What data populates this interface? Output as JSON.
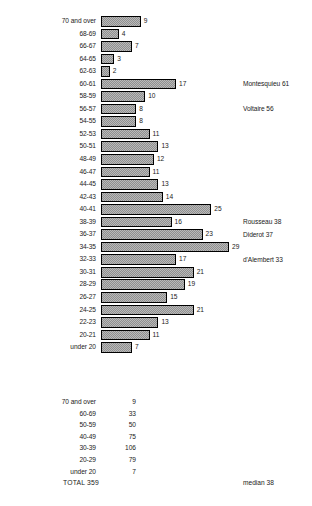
{
  "chart_data": {
    "type": "bar",
    "orientation": "horizontal",
    "title": "",
    "subtitle": "",
    "xlabel": "",
    "ylabel": "",
    "xlim": [
      0,
      29
    ],
    "grid": false,
    "legend": "none",
    "categories": [
      "70 and over",
      "68-69",
      "66-67",
      "64-65",
      "62-63",
      "60-61",
      "58-59",
      "56-57",
      "54-55",
      "52-53",
      "50-51",
      "48-49",
      "46-47",
      "44-45",
      "42-43",
      "40-41",
      "38-39",
      "36-37",
      "34-35",
      "32-33",
      "30-31",
      "28-29",
      "26-27",
      "24-25",
      "22-23",
      "20-21",
      "under 20"
    ],
    "values": [
      9,
      4,
      7,
      3,
      2,
      17,
      10,
      8,
      8,
      11,
      13,
      12,
      11,
      13,
      14,
      25,
      16,
      23,
      29,
      17,
      21,
      19,
      15,
      21,
      13,
      11,
      7
    ],
    "annotations": [
      {
        "text": "Montesquieu 61",
        "category": "60-61"
      },
      {
        "text": "Voltaire 56",
        "category": "56-57"
      },
      {
        "text": "Rousseau 38",
        "category": "38-39"
      },
      {
        "text": "Diderot 37",
        "category": "36-37"
      },
      {
        "text": "d'Alembert 33",
        "category": "32-33"
      }
    ]
  },
  "summary": {
    "rows": [
      {
        "label": "70 and over",
        "value": "9"
      },
      {
        "label": "60-69",
        "value": "33"
      },
      {
        "label": "50-59",
        "value": "50"
      },
      {
        "label": "40-49",
        "value": "75"
      },
      {
        "label": "30-39",
        "value": "106"
      },
      {
        "label": "20-29",
        "value": "79"
      },
      {
        "label": "under 20",
        "value": "7"
      }
    ],
    "total": "TOTAL 359",
    "median": "median 38"
  },
  "style": {
    "bar_fill": "#b9b9b9",
    "bar_outline": "#000000",
    "text_color": "#1a1a1a",
    "background": "#ffffff"
  }
}
